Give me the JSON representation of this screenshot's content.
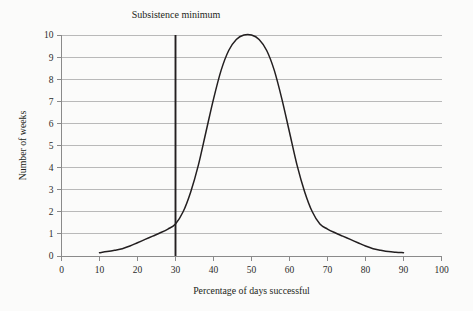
{
  "chart_data": {
    "type": "line",
    "title": "",
    "xlabel": "Percentage of days successful",
    "ylabel": "Number of weeks",
    "xlim": [
      0,
      100
    ],
    "ylim": [
      0,
      10
    ],
    "grid": true,
    "grid_axis": "y",
    "legend": "none",
    "xticks": [
      0,
      10,
      20,
      30,
      40,
      50,
      60,
      70,
      80,
      90,
      100
    ],
    "xtick_labels": [
      "0",
      "10",
      "20",
      "30",
      "40",
      "50",
      "60",
      "70",
      "80",
      "90",
      "100"
    ],
    "yticks": [
      0,
      1,
      2,
      3,
      4,
      5,
      6,
      7,
      8,
      9,
      10
    ],
    "ytick_labels": [
      "0",
      "1",
      "2",
      "3",
      "4",
      "5",
      "6",
      "7",
      "8",
      "9",
      "10"
    ],
    "series": [
      {
        "name": "Distribution of weeks by hunting success",
        "color": "#231f20",
        "x": [
          10,
          12,
          14,
          16,
          18,
          20,
          22,
          24,
          26,
          28,
          30,
          32,
          34,
          36,
          38,
          40,
          42,
          44,
          46,
          48,
          50,
          52,
          54,
          56,
          58,
          60,
          62,
          64,
          66,
          68,
          70,
          72,
          74,
          76,
          78,
          80,
          82,
          84,
          86,
          88,
          90
        ],
        "y": [
          0.15,
          0.2,
          0.26,
          0.33,
          0.45,
          0.6,
          0.75,
          0.9,
          1.05,
          1.22,
          1.45,
          2.0,
          2.9,
          4.1,
          5.6,
          7.1,
          8.4,
          9.3,
          9.8,
          10.0,
          10.0,
          9.8,
          9.3,
          8.4,
          7.1,
          5.6,
          4.1,
          2.9,
          2.0,
          1.45,
          1.22,
          1.05,
          0.9,
          0.75,
          0.6,
          0.45,
          0.33,
          0.26,
          0.2,
          0.17,
          0.15
        ]
      }
    ],
    "annotations": [
      {
        "name": "subsistence-minimum",
        "label": "Subsistence minimum",
        "type": "vline",
        "x": 30,
        "y_from": 0,
        "y_to": 10,
        "color": "#231f20"
      }
    ],
    "colors": {
      "curve": "#231f20",
      "gridline": "#b9b9b9",
      "axis": "#8a8a8a",
      "background": "#fbfbfa",
      "text": "#231f20"
    }
  }
}
